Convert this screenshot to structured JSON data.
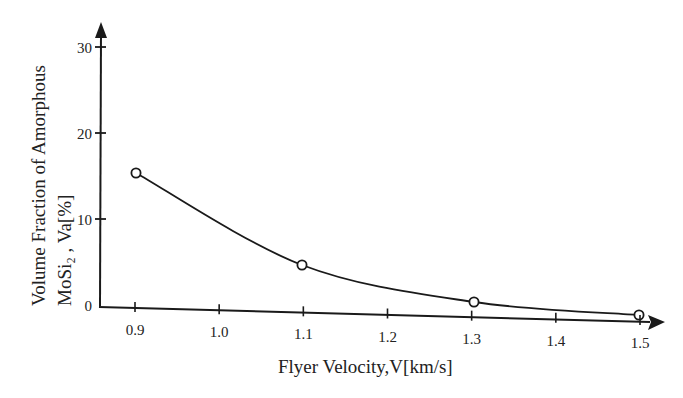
{
  "chart_data": {
    "type": "line",
    "title": "",
    "xlabel": "Flyer Velocity,V[km/s]",
    "ylabel_line1": "Volume Fraction of Amorphous",
    "ylabel_line2": "MoSi₂ , Va[%]",
    "x_ticks": [
      "0.9",
      "1.0",
      "1.1",
      "1.2",
      "1.3",
      "1.4",
      "1.5"
    ],
    "y_ticks": [
      "0",
      "10",
      "20",
      "30"
    ],
    "xlim": [
      0.86,
      1.52
    ],
    "ylim": [
      0,
      32
    ],
    "grid": false,
    "legend": "none",
    "series": [
      {
        "name": "Amorphous MoSi2 volume fraction",
        "marker": "open-circle",
        "line": "smooth-curve",
        "x": [
          0.9,
          1.1,
          1.3,
          1.5
        ],
        "y": [
          15.5,
          5,
          1,
          0
        ]
      }
    ],
    "colors": {
      "ink": "#1a1a1a",
      "background": "#ffffff"
    }
  }
}
